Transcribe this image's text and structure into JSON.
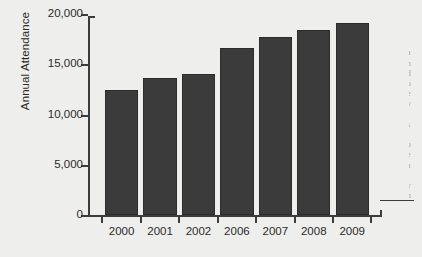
{
  "chart_data": {
    "type": "bar",
    "title": "",
    "subtitle": "",
    "xlabel": "",
    "ylabel": "Annual Attendance",
    "categories": [
      "2000",
      "2001",
      "2002",
      "2006",
      "2007",
      "2008",
      "2009"
    ],
    "values": [
      12400,
      13600,
      14000,
      16600,
      17700,
      18400,
      19100
    ],
    "ylim": [
      0,
      20000
    ],
    "ytick_labels": [
      "0",
      "5,000",
      "10,000",
      "15,000",
      "20,000"
    ],
    "ytick_values": [
      0,
      5000,
      10000,
      15000,
      20000
    ],
    "grid": false,
    "legend": "none",
    "legend_position": "none",
    "bar_color": "#3b3b3b",
    "axis_color": "#3c3c3c",
    "background_color": "#eeeeec",
    "text_color": "#2b2b2b"
  },
  "edge_sliver": {
    "lines": [
      "i",
      "t",
      "a",
      "n",
      "d",
      "o",
      "e",
      "v",
      "i",
      "s",
      "t",
      "o",
      "e",
      "a",
      "t",
      "y",
      "n"
    ]
  }
}
